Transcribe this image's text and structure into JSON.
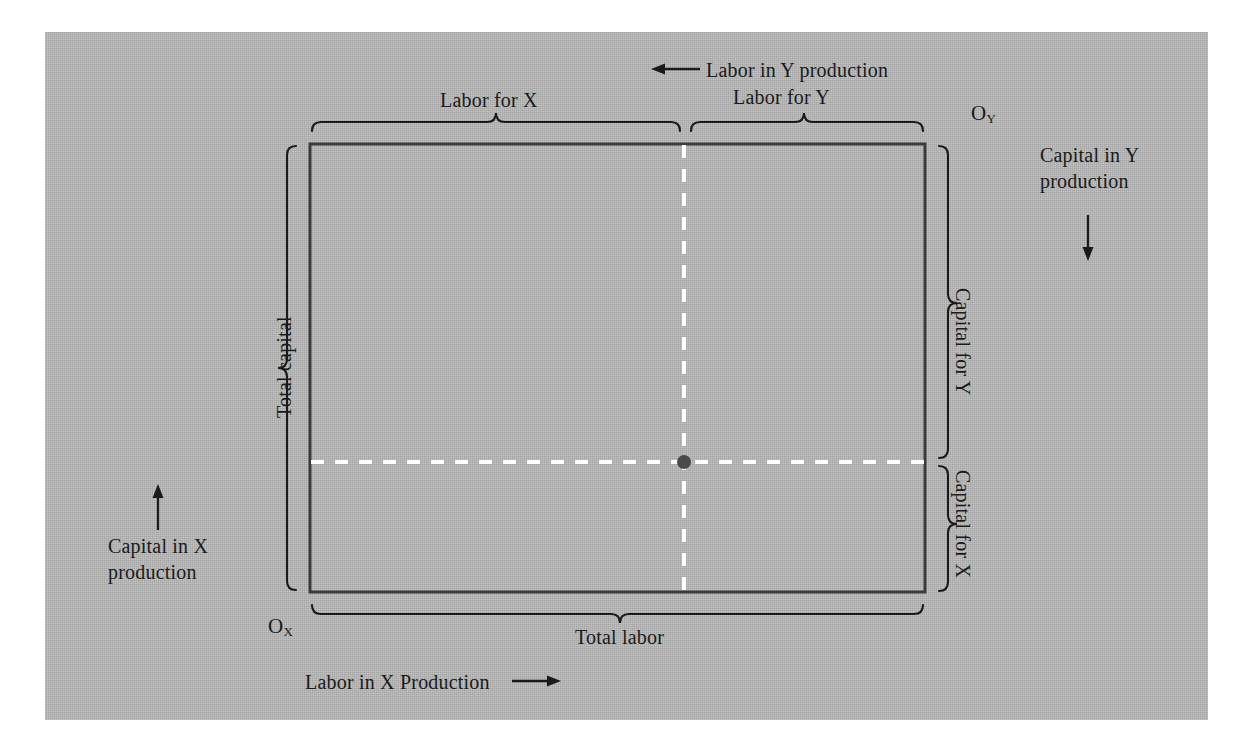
{
  "figure": {
    "background_color": "#b3b3b3",
    "page_color": "#ffffff",
    "ink_color": "#1a1a1a",
    "box_border_color": "#3b3b3b",
    "dashed_line_color": "#ffffff",
    "point_color": "#4a4a4a"
  },
  "labels": {
    "labor_for_x": "Labor for X",
    "labor_for_y": "Labor for Y",
    "labor_in_y_production": "Labor in Y production",
    "labor_in_x_production": "Labor in X Production",
    "total_labor": "Total labor",
    "total_capital": "Total capital",
    "capital_for_y": "Capital for Y",
    "capital_for_x": "Capital for X",
    "capital_in_y_production": "Capital in Y production",
    "capital_in_x_production": "Capital in X production",
    "origin_x_main": "O",
    "origin_x_sub": "X",
    "origin_y_main": "O",
    "origin_y_sub": "Y"
  },
  "geometry": {
    "box_left": 310,
    "box_top": 144,
    "box_right": 925,
    "box_bottom": 592,
    "allocation_point_x": 684,
    "allocation_point_y": 462
  }
}
